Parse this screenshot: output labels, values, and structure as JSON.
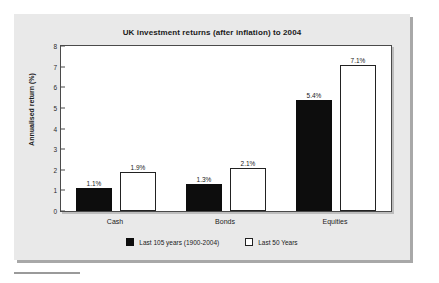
{
  "chart_data": {
    "type": "bar",
    "title": "UK investment returns (after inflation) to 2004",
    "xlabel": "",
    "ylabel": "Annualised return (%)",
    "ylim": [
      0,
      8
    ],
    "yticks": [
      "0",
      "1",
      "2",
      "3",
      "4",
      "5",
      "6",
      "7",
      "8"
    ],
    "grid": false,
    "legend_position": "bottom",
    "categories": [
      "Cash",
      "Bonds",
      "Equities"
    ],
    "series": [
      {
        "name": "Last 105 years (1900-2004)",
        "color": "#0d0d0d",
        "values": [
          1.1,
          1.3,
          5.4
        ],
        "labels": [
          "1.1%",
          "1.3%",
          "5.4%"
        ]
      },
      {
        "name": "Last 50 Years",
        "color": "#ffffff",
        "values": [
          1.9,
          2.1,
          7.1
        ],
        "labels": [
          "1.9%",
          "2.1%",
          "7.1%"
        ]
      }
    ]
  },
  "legend": {
    "items": [
      {
        "label": "Last 105 years (1900-2004)",
        "style": "dark"
      },
      {
        "label": "Last 50 Years",
        "style": "light"
      }
    ]
  },
  "colors": {
    "page_background": "#ffffff",
    "panel_background": "#e9e9e9",
    "plot_background": "#ffffff",
    "axis": "#4a4a4a",
    "series_dark": "#0d0d0d",
    "series_light": "#ffffff",
    "text": "#1a1a1a"
  }
}
